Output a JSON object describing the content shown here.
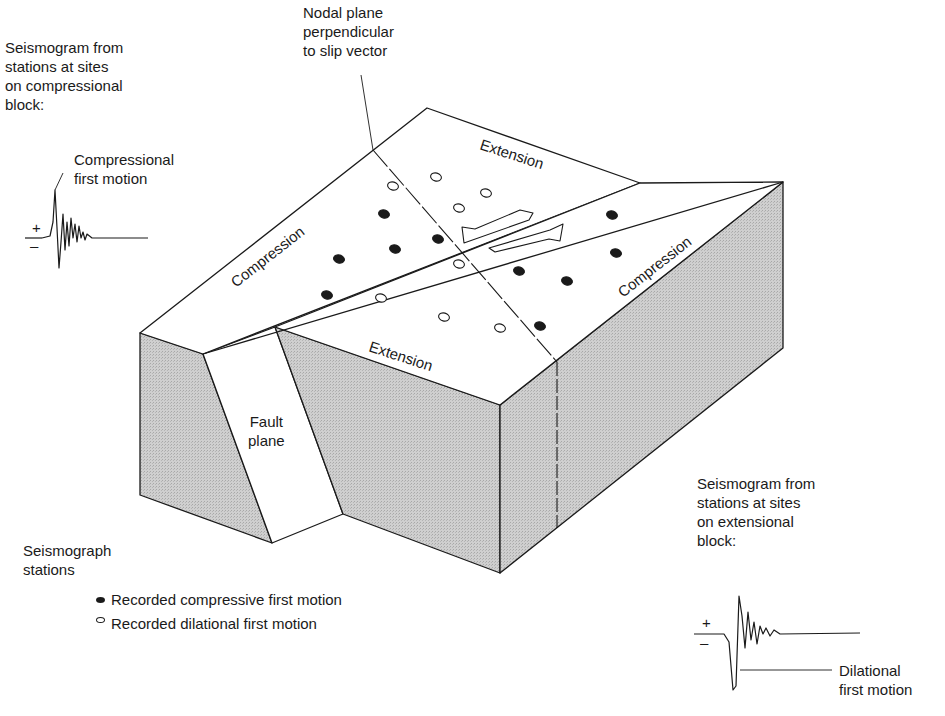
{
  "figure": {
    "type": "block diagram"
  },
  "labels": {
    "nodal_plane": "Nodal plane\nperpendicular\nto slip vector",
    "compressional_seismogram_caption": "Seismogram from\nstations at sites\non compressional\nblock:",
    "compressional_first_motion": "Compressional\nfirst motion",
    "extensional_seismogram_caption": "Seismogram from\nstations at sites\non extensional\nblock:",
    "dilational_first_motion": "Dilational\nfirst motion",
    "fault_plane": "Fault\nplane",
    "quadrant_compression_left": "Compression",
    "quadrant_compression_right": "Compression",
    "quadrant_extension_top": "Extension",
    "quadrant_extension_bottom": "Extension",
    "plus_sign": "+",
    "minus_sign": "–"
  },
  "legend": {
    "title": "Seismograph\nstations",
    "items": [
      {
        "symbol": "filled-ellipse",
        "label": "Recorded compressive first motion"
      },
      {
        "symbol": "open-ellipse",
        "label": "Recorded dilational first motion"
      }
    ]
  },
  "colors": {
    "ink": "#1a1a1a",
    "block_side": "#c9c9c9",
    "block_top": "#ffffff",
    "background": "#ffffff"
  },
  "stations": {
    "compressive": [
      [
        384,
        214
      ],
      [
        395,
        249
      ],
      [
        438,
        239
      ],
      [
        339,
        259
      ],
      [
        327,
        295
      ],
      [
        612,
        215
      ],
      [
        616,
        253
      ],
      [
        519,
        271
      ],
      [
        567,
        281
      ],
      [
        540,
        326
      ]
    ],
    "dilational": [
      [
        393,
        186
      ],
      [
        436,
        177
      ],
      [
        486,
        193
      ],
      [
        459,
        208
      ],
      [
        459,
        264
      ],
      [
        381,
        298
      ],
      [
        444,
        317
      ],
      [
        500,
        328
      ]
    ]
  }
}
